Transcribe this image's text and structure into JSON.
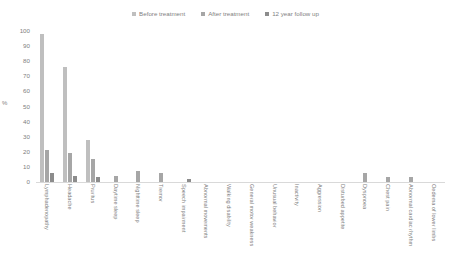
{
  "chart_data": {
    "type": "bar",
    "title": "",
    "xlabel": "",
    "ylabel": "%",
    "ylim": [
      0,
      100
    ],
    "yticks": [
      0,
      10,
      20,
      30,
      40,
      50,
      60,
      70,
      80,
      90,
      100
    ],
    "grid": false,
    "legend_position": "top-center",
    "categories": [
      "Lymphadenopathy",
      "Headache",
      "Pruritus",
      "Daytime sleep",
      "Nighttime sleep",
      "Tremor",
      "Speech impairment",
      "Abnormal movements",
      "Walking disability",
      "General motor weakness",
      "Unusual behavior",
      "Inactivity",
      "Aggression",
      "Disturbed appetite",
      "Dyspnoea",
      "Chest pain",
      "Abnormal cardiac rhythm",
      "Oedema of lower limbs"
    ],
    "series": [
      {
        "name": "Before treatment",
        "color": "#bfbfbf",
        "values": [
          98,
          76,
          28,
          0,
          0,
          0,
          0,
          0,
          0,
          0,
          0,
          0,
          0,
          0,
          0,
          0,
          0,
          0
        ]
      },
      {
        "name": "After treatment",
        "color": "#a6a6a6",
        "values": [
          21,
          19,
          15,
          4,
          7,
          6,
          0,
          0,
          0,
          0,
          0,
          0,
          0,
          0,
          6,
          3,
          3,
          0
        ]
      },
      {
        "name": "12 year follow up",
        "color": "#8c8c8c",
        "values": [
          6,
          4,
          3,
          0,
          0,
          0,
          2,
          0,
          0,
          0,
          0,
          0,
          0,
          0,
          0,
          0,
          0,
          0
        ]
      }
    ]
  },
  "legend": {
    "items": [
      {
        "label": "Before treatment",
        "color": "#bfbfbf"
      },
      {
        "label": "After treatment",
        "color": "#a6a6a6"
      },
      {
        "label": "12 year follow up",
        "color": "#8c8c8c"
      }
    ]
  },
  "axes": {
    "y_title": "%",
    "y_tick_labels": [
      "100",
      "90",
      "80",
      "70",
      "60",
      "50",
      "40",
      "30",
      "20",
      "10",
      "0"
    ]
  }
}
